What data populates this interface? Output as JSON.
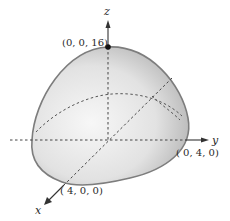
{
  "diagram": {
    "type": "3d-surface",
    "axes": {
      "x": {
        "label": "x"
      },
      "y": {
        "label": "y"
      },
      "z": {
        "label": "z"
      }
    },
    "points": [
      {
        "id": "apex",
        "label": "(0, 0, 16)"
      },
      {
        "id": "y-intercept",
        "label": "( 0, 4, 0)"
      },
      {
        "id": "x-intercept",
        "label": "( 4, 0, 0)"
      }
    ],
    "colors": {
      "surface_light": "#f4f4f4",
      "surface_dark": "#a9a9a9",
      "outline": "#7a7a7a",
      "axis": "#333333",
      "dashed": "#555555"
    }
  }
}
